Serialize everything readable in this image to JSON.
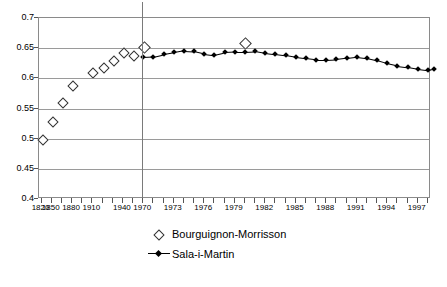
{
  "chart_data": {
    "type": "scatter",
    "title": "",
    "xlabel": "",
    "ylabel": "",
    "ylim": [
      0.4,
      0.7
    ],
    "ytick_labels": [
      "0.7",
      "0.65",
      "0.6",
      "0.55",
      "0.5",
      "0.45",
      "0.4"
    ],
    "ytick_values": [
      0.7,
      0.65,
      0.6,
      0.55,
      0.5,
      0.45,
      0.4
    ],
    "grid": "horizontal",
    "legend_position": "bottom",
    "annotations": [
      {
        "type": "vertical-line",
        "at_category": "1970",
        "label": ""
      }
    ],
    "x_categories": [
      "1820",
      "1850",
      "1865",
      "1880",
      "1890",
      "1910",
      "1929",
      "1934",
      "1950",
      "1960",
      "1970",
      "1971",
      "1972",
      "1973",
      "1974",
      "1975",
      "1976",
      "1977",
      "1978",
      "1979",
      "1980",
      "1981",
      "1982",
      "1983",
      "1984",
      "1985",
      "1986",
      "1987",
      "1988",
      "1989",
      "1990",
      "1991",
      "1992",
      "1993",
      "1994",
      "1995",
      "1996",
      "1997",
      "1998"
    ],
    "xtick_labels_shown": [
      "1820",
      "1850",
      "1880",
      "1910",
      "1940",
      "1970",
      "1973",
      "1976",
      "1979",
      "1982",
      "1985",
      "1988",
      "1991",
      "1994",
      "1997"
    ],
    "series": [
      {
        "name": "Bourguignon-Morrisson",
        "marker": "open-diamond",
        "line": false,
        "points": [
          {
            "x": "1820",
            "y": 0.5
          },
          {
            "x": "1850",
            "y": 0.53
          },
          {
            "x": "1865",
            "y": 0.56
          },
          {
            "x": "1880",
            "y": 0.589
          },
          {
            "x": "1910",
            "y": 0.611
          },
          {
            "x": "1929",
            "y": 0.618
          },
          {
            "x": "1934",
            "y": 0.63
          },
          {
            "x": "1950",
            "y": 0.643
          },
          {
            "x": "1960",
            "y": 0.639
          },
          {
            "x": "1970",
            "y": 0.652
          },
          {
            "x": "1980",
            "y": 0.66
          }
        ]
      },
      {
        "name": "Sala-i-Martin",
        "marker": "filled-diamond",
        "line": true,
        "points": [
          {
            "x": "1970",
            "y": 0.635
          },
          {
            "x": "1971",
            "y": 0.636
          },
          {
            "x": "1972",
            "y": 0.64
          },
          {
            "x": "1973",
            "y": 0.643
          },
          {
            "x": "1974",
            "y": 0.646
          },
          {
            "x": "1975",
            "y": 0.645
          },
          {
            "x": "1976",
            "y": 0.641
          },
          {
            "x": "1977",
            "y": 0.639
          },
          {
            "x": "1978",
            "y": 0.643
          },
          {
            "x": "1979",
            "y": 0.644
          },
          {
            "x": "1980",
            "y": 0.644
          },
          {
            "x": "1981",
            "y": 0.645
          },
          {
            "x": "1982",
            "y": 0.642
          },
          {
            "x": "1983",
            "y": 0.64
          },
          {
            "x": "1984",
            "y": 0.638
          },
          {
            "x": "1985",
            "y": 0.635
          },
          {
            "x": "1986",
            "y": 0.633
          },
          {
            "x": "1987",
            "y": 0.631
          },
          {
            "x": "1988",
            "y": 0.631
          },
          {
            "x": "1989",
            "y": 0.632
          },
          {
            "x": "1990",
            "y": 0.634
          },
          {
            "x": "1991",
            "y": 0.636
          },
          {
            "x": "1992",
            "y": 0.634
          },
          {
            "x": "1993",
            "y": 0.63
          },
          {
            "x": "1994",
            "y": 0.625
          },
          {
            "x": "1995",
            "y": 0.621
          },
          {
            "x": "1996",
            "y": 0.619
          },
          {
            "x": "1997",
            "y": 0.616
          },
          {
            "x": "1998",
            "y": 0.614
          },
          {
            "x": "1998b",
            "y": 0.616
          }
        ]
      }
    ]
  },
  "legend": {
    "entries": [
      {
        "label": "Bourguignon-Morrisson",
        "marker": "open-diamond"
      },
      {
        "label": "Sala-i-Martin",
        "marker": "filled-diamond-line"
      }
    ]
  }
}
